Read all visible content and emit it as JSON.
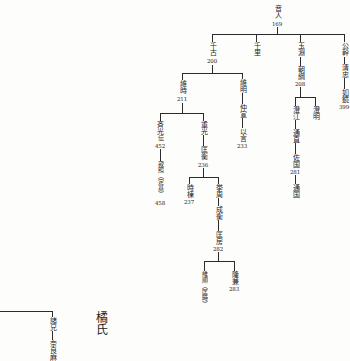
{
  "oe_tree": {
    "nodes": [
      {
        "name": "音人",
        "number": "169"
      },
      {
        "name": "千古",
        "number": "200"
      },
      {
        "name": "千里"
      },
      {
        "name": "玉淵"
      },
      {
        "name": "朝綱",
        "number": "208"
      },
      {
        "name": "公幹"
      },
      {
        "name": "清忠"
      },
      {
        "name": "如鏡",
        "number": "399"
      },
      {
        "name": "維時",
        "number": "211"
      },
      {
        "name": "維明"
      },
      {
        "name": "仲宣"
      },
      {
        "name": "以言",
        "number": "233"
      },
      {
        "name": "澄江"
      },
      {
        "name": "通直"
      },
      {
        "name": "佐国",
        "number": "281"
      },
      {
        "name": "通国"
      },
      {
        "name": "澄明"
      },
      {
        "name": "斉光",
        "note": "伝",
        "number": "452"
      },
      {
        "name": "寂照（定基）",
        "number": "458"
      },
      {
        "name": "重光"
      },
      {
        "name": "匡衡",
        "number": "236"
      },
      {
        "name": "時棟",
        "number": "237"
      },
      {
        "name": "挙周"
      },
      {
        "name": "成衡"
      },
      {
        "name": "匡房",
        "number": "282"
      },
      {
        "name": "維順（匡時）"
      },
      {
        "name": "隆兼",
        "number": "283"
      }
    ]
  },
  "tachibana": {
    "title": "橘氏",
    "nodes": [
      {
        "name": "諸兄"
      },
      {
        "name": "奈良麻"
      }
    ]
  }
}
